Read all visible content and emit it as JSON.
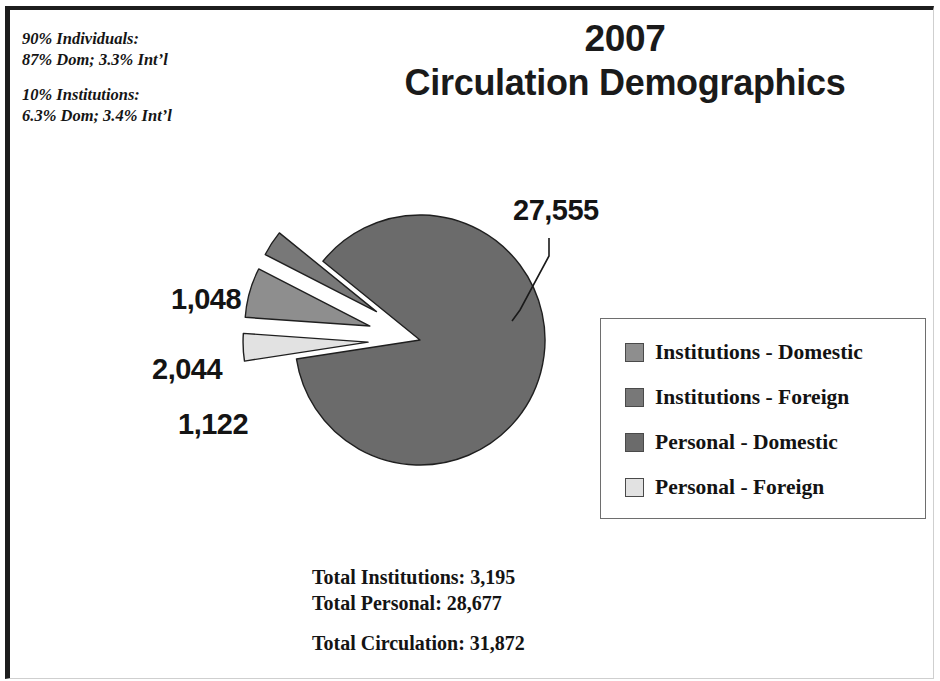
{
  "title": {
    "line1": "2007",
    "line2": "Circulation Demographics"
  },
  "annotation": {
    "individuals_header": "90% Individuals:",
    "individuals_detail": "87% Dom; 3.3% Int’l",
    "institutions_header": "10% Institutions:",
    "institutions_detail": "6.3% Dom; 3.4% Int’l"
  },
  "legend": {
    "items": [
      {
        "label": "Institutions - Domestic",
        "color": "#8e8e8e"
      },
      {
        "label": "Institutions - Foreign",
        "color": "#787878"
      },
      {
        "label": "Personal - Domestic",
        "color": "#6b6b6b"
      },
      {
        "label": "Personal - Foreign",
        "color": "#e2e2e2"
      }
    ]
  },
  "totals": {
    "institutions": "Total Institutions: 3,195",
    "personal": "Total Personal: 28,677",
    "circulation": "Total Circulation: 31,872"
  },
  "chart_data": {
    "type": "pie",
    "title": "2007 Circulation Demographics",
    "labels": [
      "Institutions - Domestic",
      "Institutions - Foreign",
      "Personal - Domestic",
      "Personal - Foreign"
    ],
    "values": [
      2044,
      1048,
      27555,
      1122
    ],
    "value_labels": [
      "2,044",
      "1,048",
      "27,555",
      "1,122"
    ],
    "colors": [
      "#8e8e8e",
      "#787878",
      "#6b6b6b",
      "#e2e2e2"
    ],
    "total": 31872,
    "exploded": [
      true,
      true,
      false,
      true
    ],
    "legend_position": "right",
    "grid": false,
    "notes": [
      "90% Individuals: 87% Dom; 3.3% Int’l",
      "10% Institutions: 6.3% Dom; 3.4% Int’l"
    ]
  },
  "geometry": {
    "center_x": 420,
    "center_y": 340,
    "radius": 125
  }
}
